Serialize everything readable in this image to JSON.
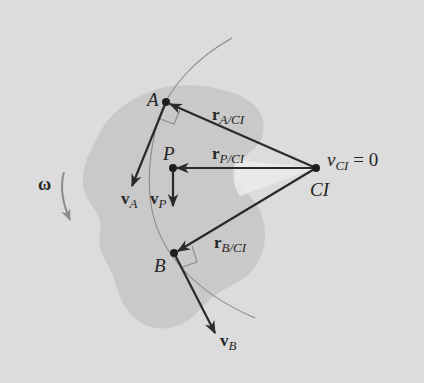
{
  "diagram": {
    "colors": {
      "background": "#dcdcdc",
      "body": "#c9c9c9",
      "highlight": "#ececec",
      "ink": "#2a2a2a",
      "path": "#8a8a8a",
      "omega_arrow": "#8c8c8c"
    },
    "points": {
      "A": {
        "label": "A",
        "x": 166,
        "y": 102
      },
      "P": {
        "label": "P",
        "x": 173,
        "y": 168
      },
      "B": {
        "label": "B",
        "x": 174,
        "y": 253
      },
      "CI": {
        "label": "CI",
        "x": 316,
        "y": 168
      }
    },
    "labels": {
      "A": "A",
      "P": "P",
      "B": "B",
      "CI": "CI",
      "r_A_main": "r",
      "r_A_sub": "A/CI",
      "r_P_main": "r",
      "r_P_sub": "P/CI",
      "r_B_main": "r",
      "r_B_sub": "B/CI",
      "v_A_main": "v",
      "v_A_sub": "A",
      "v_P_main": "v",
      "v_P_sub": "P",
      "v_B_main": "v",
      "v_B_sub": "B",
      "v_CI_main": "v",
      "v_CI_sub": "CI",
      "v_CI_eq": " = 0",
      "omega": "ω"
    }
  }
}
